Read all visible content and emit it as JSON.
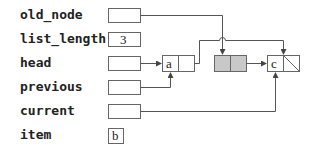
{
  "variables": [
    {
      "name": "old_node",
      "value": "",
      "kind": "pointer"
    },
    {
      "name": "list_length",
      "value": "3",
      "kind": "int"
    },
    {
      "name": "head",
      "value": "",
      "kind": "pointer"
    },
    {
      "name": "previous",
      "value": "",
      "kind": "pointer"
    },
    {
      "name": "current",
      "value": "",
      "kind": "pointer"
    },
    {
      "name": "item",
      "value": "b",
      "kind": "char"
    }
  ],
  "nodes": [
    {
      "id": "node-a",
      "data": "a",
      "shaded": false
    },
    {
      "id": "node-removed",
      "data": "",
      "shaded": true
    },
    {
      "id": "node-c",
      "data": "c",
      "shaded": false,
      "next": "null"
    }
  ],
  "colors": {
    "line": "#555555",
    "shade": "#c8c8c8",
    "text": "#222222"
  }
}
